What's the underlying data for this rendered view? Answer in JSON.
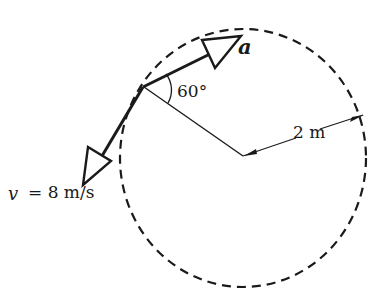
{
  "diagram": {
    "type": "kinematics-circular-motion",
    "colors": {
      "ink": "#1a1a1a",
      "background": "#ffffff"
    },
    "circle": {
      "style": "dashed",
      "cx": 243,
      "cy": 158,
      "rx": 123,
      "ry": 129
    },
    "labels": {
      "acceleration": "a",
      "angle": "60°",
      "radius": "2 m",
      "velocity_var": "v",
      "velocity_value": "= 8 m/s"
    },
    "vectors": [
      {
        "name": "acceleration",
        "label": "a"
      },
      {
        "name": "velocity",
        "label": "v = 8 m/s"
      }
    ],
    "angle_between_a_and_radius_deg": 60,
    "radius_m": 2,
    "speed_mps": 8
  }
}
